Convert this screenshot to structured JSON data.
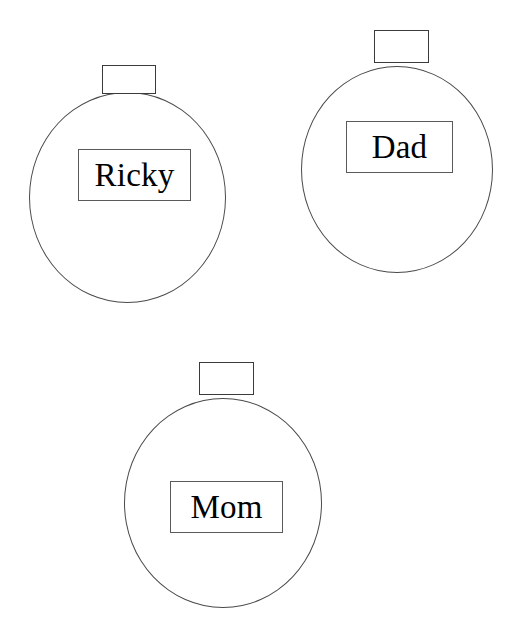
{
  "page": {
    "background_color": "#ffffff",
    "outline_color": "#4a4a4a",
    "text_color": "#000000"
  },
  "ornaments": [
    {
      "id": "ricky",
      "name": "Ricky",
      "shape": "circle",
      "cap_shape": "rectangle",
      "position": "top-left"
    },
    {
      "id": "dad",
      "name": "Dad",
      "shape": "circle",
      "cap_shape": "rectangle",
      "position": "top-right"
    },
    {
      "id": "mom",
      "name": "Mom",
      "shape": "circle",
      "cap_shape": "rectangle",
      "position": "bottom-center"
    }
  ]
}
